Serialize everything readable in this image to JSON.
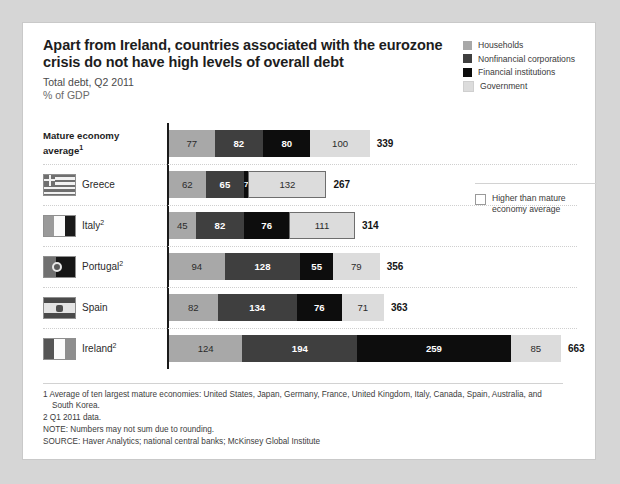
{
  "header": {
    "title": "Apart from Ireland, countries associated with the eurozone crisis do not have high levels of overall debt",
    "subtitle": "Total debt, Q2 2011",
    "units": "% of GDP"
  },
  "legend": {
    "items": [
      {
        "label": "Households",
        "color": "#a8a8a8"
      },
      {
        "label": "Nonfinancial corporations",
        "color": "#3f3f3f"
      },
      {
        "label": "Financial institutions",
        "color": "#0d0d0d"
      },
      {
        "label": "Government",
        "color": "#dcdcdc"
      }
    ],
    "secondary": {
      "label": "Higher than mature economy average"
    }
  },
  "chart_data": {
    "type": "bar",
    "orientation": "horizontal",
    "stacked": true,
    "title": "Apart from Ireland, countries associated with the eurozone crisis do not have high levels of overall debt",
    "subtitle": "Total debt, Q2 2011",
    "ylabel": "",
    "xlabel": "% of GDP",
    "grid": false,
    "legend_position": "top-right",
    "categories": [
      "Mature economy average",
      "Greece",
      "Italy",
      "Portugal",
      "Spain",
      "Ireland"
    ],
    "series": [
      {
        "name": "Households",
        "color": "#a8a8a8",
        "values": [
          77,
          62,
          45,
          94,
          82,
          124
        ]
      },
      {
        "name": "Nonfinancial corporations",
        "color": "#3f3f3f",
        "values": [
          82,
          65,
          82,
          128,
          134,
          194
        ]
      },
      {
        "name": "Financial institutions",
        "color": "#0d0d0d",
        "values": [
          80,
          7,
          76,
          55,
          76,
          259
        ]
      },
      {
        "name": "Government",
        "color": "#dcdcdc",
        "values": [
          100,
          132,
          111,
          79,
          71,
          85
        ]
      }
    ],
    "totals": [
      339,
      267,
      314,
      356,
      363,
      663
    ],
    "highlighted_above_average": {
      "Greece": [
        "Government"
      ],
      "Italy": [
        "Government"
      ]
    },
    "xlim": [
      0,
      663
    ]
  },
  "rows": [
    {
      "name": "Mature economy average",
      "label": "Mature economy",
      "label2": "average",
      "sup": "1",
      "flag": "none",
      "total": "339",
      "segments": [
        {
          "cat": "Households",
          "value": "77",
          "v": 77,
          "color": "#a8a8a8",
          "text": "dark",
          "outlined": false
        },
        {
          "cat": "Nonfinancial corporations",
          "value": "82",
          "v": 82,
          "color": "#3f3f3f",
          "text": "light",
          "outlined": false
        },
        {
          "cat": "Financial institutions",
          "value": "80",
          "v": 80,
          "color": "#0d0d0d",
          "text": "light",
          "outlined": false
        },
        {
          "cat": "Government",
          "value": "100",
          "v": 100,
          "color": "#dcdcdc",
          "text": "dark",
          "outlined": false
        }
      ]
    },
    {
      "name": "Greece",
      "label": "Greece",
      "label2": "",
      "sup": "",
      "flag": "greece",
      "total": "267",
      "segments": [
        {
          "cat": "Households",
          "value": "62",
          "v": 62,
          "color": "#a8a8a8",
          "text": "dark",
          "outlined": false
        },
        {
          "cat": "Nonfinancial corporations",
          "value": "65",
          "v": 65,
          "color": "#3f3f3f",
          "text": "light",
          "outlined": false
        },
        {
          "cat": "Financial institutions",
          "value": "7",
          "v": 7,
          "color": "#0d0d0d",
          "text": "light",
          "outlined": false
        },
        {
          "cat": "Government",
          "value": "132",
          "v": 132,
          "color": "#dcdcdc",
          "text": "dark",
          "outlined": true
        }
      ]
    },
    {
      "name": "Italy",
      "label": "Italy",
      "label2": "",
      "sup": "2",
      "flag": "italy",
      "total": "314",
      "segments": [
        {
          "cat": "Households",
          "value": "45",
          "v": 45,
          "color": "#a8a8a8",
          "text": "dark",
          "outlined": false
        },
        {
          "cat": "Nonfinancial corporations",
          "value": "82",
          "v": 82,
          "color": "#3f3f3f",
          "text": "light",
          "outlined": false
        },
        {
          "cat": "Financial institutions",
          "value": "76",
          "v": 76,
          "color": "#0d0d0d",
          "text": "light",
          "outlined": false
        },
        {
          "cat": "Government",
          "value": "111",
          "v": 111,
          "color": "#dcdcdc",
          "text": "dark",
          "outlined": true
        }
      ]
    },
    {
      "name": "Portugal",
      "label": "Portugal",
      "label2": "",
      "sup": "2",
      "flag": "portugal",
      "total": "356",
      "segments": [
        {
          "cat": "Households",
          "value": "94",
          "v": 94,
          "color": "#a8a8a8",
          "text": "dark",
          "outlined": false
        },
        {
          "cat": "Nonfinancial corporations",
          "value": "128",
          "v": 128,
          "color": "#3f3f3f",
          "text": "light",
          "outlined": false
        },
        {
          "cat": "Financial institutions",
          "value": "55",
          "v": 55,
          "color": "#0d0d0d",
          "text": "light",
          "outlined": false
        },
        {
          "cat": "Government",
          "value": "79",
          "v": 79,
          "color": "#dcdcdc",
          "text": "dark",
          "outlined": false
        }
      ]
    },
    {
      "name": "Spain",
      "label": "Spain",
      "label2": "",
      "sup": "",
      "flag": "spain",
      "total": "363",
      "segments": [
        {
          "cat": "Households",
          "value": "82",
          "v": 82,
          "color": "#a8a8a8",
          "text": "dark",
          "outlined": false
        },
        {
          "cat": "Nonfinancial corporations",
          "value": "134",
          "v": 134,
          "color": "#3f3f3f",
          "text": "light",
          "outlined": false
        },
        {
          "cat": "Financial institutions",
          "value": "76",
          "v": 76,
          "color": "#0d0d0d",
          "text": "light",
          "outlined": false
        },
        {
          "cat": "Government",
          "value": "71",
          "v": 71,
          "color": "#dcdcdc",
          "text": "dark",
          "outlined": false
        }
      ]
    },
    {
      "name": "Ireland",
      "label": "Ireland",
      "label2": "",
      "sup": "2",
      "flag": "ireland",
      "total": "663",
      "segments": [
        {
          "cat": "Households",
          "value": "124",
          "v": 124,
          "color": "#a8a8a8",
          "text": "dark",
          "outlined": false
        },
        {
          "cat": "Nonfinancial corporations",
          "value": "194",
          "v": 194,
          "color": "#3f3f3f",
          "text": "light",
          "outlined": false
        },
        {
          "cat": "Financial institutions",
          "value": "259",
          "v": 259,
          "color": "#0d0d0d",
          "text": "light",
          "outlined": false
        },
        {
          "cat": "Government",
          "value": "85",
          "v": 85,
          "color": "#dcdcdc",
          "text": "dark",
          "outlined": false
        }
      ]
    }
  ],
  "footnotes": {
    "fn1": "1  Average of ten largest mature economies: United States, Japan, Germany, France, United Kingdom, Italy, Canada, Spain, Australia, and South Korea.",
    "fn2": "2  Q1 2011 data.",
    "note": "NOTE: Numbers may not sum due to rounding.",
    "source": "SOURCE: Haver Analytics; national central banks; McKinsey Global Institute"
  }
}
